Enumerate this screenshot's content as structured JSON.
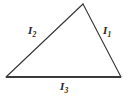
{
  "figure": {
    "background_color": "#ffffff",
    "width": 127,
    "height": 97
  },
  "chart_data": {
    "type": "diagram",
    "title": "",
    "subtitle": "",
    "xlabel": "",
    "ylabel": "",
    "grid": false,
    "legend": false,
    "shape": "triangle",
    "shape_kind": "scalene",
    "stroke_color": "#333333",
    "fill_color": "none",
    "vertices": [
      {
        "name": "bottom-left",
        "x": 6,
        "y": 77
      },
      {
        "name": "apex",
        "x": 83,
        "y": 4
      },
      {
        "name": "bottom-right",
        "x": 121,
        "y": 77
      }
    ],
    "edges": [
      {
        "name": "right-side",
        "label": "I1",
        "from": "apex",
        "to": "bottom-right",
        "stroke_width": 1.1
      },
      {
        "name": "left-side",
        "label": "I2",
        "from": "bottom-left",
        "to": "apex",
        "stroke_width": 1.1
      },
      {
        "name": "bottom-side",
        "label": "I3",
        "from": "bottom-left",
        "to": "bottom-right",
        "stroke_width": 1.8
      }
    ]
  },
  "labels": {
    "side_1": {
      "symbol": "I",
      "subscript": "1"
    },
    "side_2": {
      "symbol": "I",
      "subscript": "2"
    },
    "side_3": {
      "symbol": "I",
      "subscript": "3"
    }
  }
}
